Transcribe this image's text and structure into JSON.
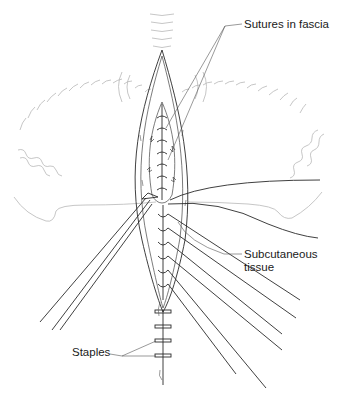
{
  "figure": {
    "type": "surgical-illustration",
    "labels": [
      {
        "id": "sutures-in-fascia",
        "text": "Sutures in fascia"
      },
      {
        "id": "subcutaneous-tissue",
        "text": "Subcutaneous\ntissue"
      },
      {
        "id": "staples",
        "text": "Staples"
      }
    ]
  },
  "labels": {
    "sutures": "Sutures in fascia",
    "subq_line1": "Subcutaneous",
    "subq_line2": "tissue",
    "staples": "Staples"
  },
  "colors": {
    "ink": "#2a2a2a",
    "faint_skin_outline": "#b8b8b8",
    "background": "#ffffff"
  }
}
